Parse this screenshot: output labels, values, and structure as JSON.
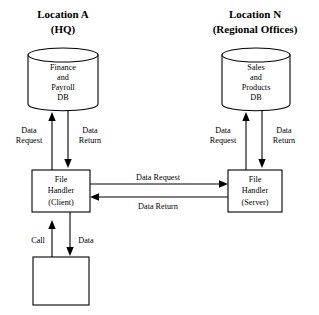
{
  "diagram": {
    "title_left": "Location A",
    "subtitle_left": "(HQ)",
    "title_right": "Location N",
    "subtitle_right": "(Regional Offices)",
    "colors": {
      "stroke": "#000000",
      "fill": "#ffffff",
      "background": "#ffffff"
    },
    "nodes": {
      "db_left": {
        "type": "cylinder",
        "line1": "Finance",
        "line2": "and",
        "line3": "Payroll",
        "line4": "DB"
      },
      "db_right": {
        "type": "cylinder",
        "line1": "Sales",
        "line2": "and",
        "line3": "Products",
        "line4": "DB"
      },
      "handler_client": {
        "type": "box",
        "line1": "File",
        "line2": "Handler",
        "line3": "(Client)"
      },
      "handler_server": {
        "type": "box",
        "line1": "File",
        "line2": "Handler",
        "line3": "(Server)"
      },
      "application_box": {
        "type": "box",
        "label": ""
      }
    },
    "edges": {
      "left_up": {
        "line1": "Data",
        "line2": "Request",
        "direction": "up"
      },
      "left_down": {
        "line1": "Data",
        "line2": "Return",
        "direction": "down"
      },
      "right_up": {
        "line1": "Data",
        "line2": "Request",
        "direction": "up"
      },
      "right_down": {
        "line1": "Data",
        "line2": "Return",
        "direction": "down"
      },
      "mid_request": {
        "label": "Data Request",
        "direction": "right"
      },
      "mid_return": {
        "label": "Data Return",
        "direction": "left"
      },
      "bottom_call": {
        "label": "Call",
        "direction": "up"
      },
      "bottom_data": {
        "label": "Data",
        "direction": "down"
      }
    }
  }
}
